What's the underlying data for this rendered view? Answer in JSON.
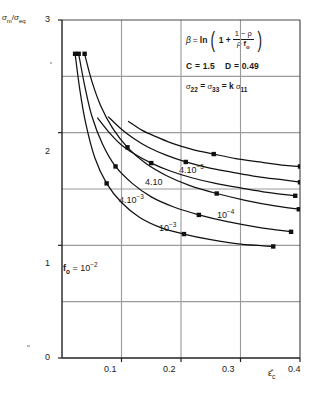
{
  "chart_data": {
    "type": "line",
    "title": "",
    "xlabel": "ε̂c",
    "ylabel": "σm/σeq",
    "xlim": [
      0,
      0.4
    ],
    "ylim": [
      0,
      3
    ],
    "grid": true,
    "legend_position": "inline-annotations",
    "x_ticks": [
      "0.1",
      "0.2",
      "0.3",
      "0.4"
    ],
    "x_tick_values": [
      0.1,
      0.2,
      0.3,
      0.4
    ],
    "y_ticks": [
      "0",
      "1",
      "2",
      "3"
    ],
    "y_tick_values": [
      0,
      1,
      2,
      3
    ],
    "x_gridlines": [
      0.1,
      0.2,
      0.3
    ],
    "y_gridlines": [
      0.5,
      1.0,
      1.5,
      2.0,
      2.5
    ],
    "series": [
      {
        "name": "f_o = 10^-2",
        "label": "fₒ = 10⁻²",
        "marker": "square",
        "x": [
          0.022,
          0.03,
          0.04,
          0.055,
          0.075,
          0.1,
          0.13,
          0.165,
          0.205,
          0.25,
          0.3,
          0.355
        ],
        "y": [
          2.7,
          2.38,
          2.08,
          1.78,
          1.55,
          1.38,
          1.25,
          1.16,
          1.1,
          1.05,
          1.01,
          0.99
        ],
        "marker_points": [
          [
            0.022,
            2.7
          ],
          [
            0.075,
            1.55
          ],
          [
            0.205,
            1.1
          ],
          [
            0.355,
            0.99
          ]
        ]
      },
      {
        "name": "4.10^-3",
        "label": "4.10⁻³",
        "marker": "square",
        "x": [
          0.028,
          0.038,
          0.05,
          0.068,
          0.09,
          0.118,
          0.15,
          0.188,
          0.23,
          0.278,
          0.33,
          0.385
        ],
        "y": [
          2.7,
          2.42,
          2.15,
          1.9,
          1.7,
          1.55,
          1.43,
          1.34,
          1.27,
          1.21,
          1.16,
          1.12
        ],
        "marker_points": [
          [
            0.028,
            2.7
          ],
          [
            0.09,
            1.7
          ],
          [
            0.23,
            1.27
          ],
          [
            0.385,
            1.12
          ]
        ]
      },
      {
        "name": "10^-3",
        "label": "10⁻³",
        "marker": "square",
        "x": [
          0.038,
          0.05,
          0.065,
          0.085,
          0.11,
          0.14,
          0.175,
          0.215,
          0.26,
          0.308,
          0.358,
          0.398
        ],
        "y": [
          2.7,
          2.46,
          2.24,
          2.04,
          1.87,
          1.73,
          1.62,
          1.53,
          1.46,
          1.4,
          1.35,
          1.32
        ],
        "marker_points": [
          [
            0.038,
            2.7
          ],
          [
            0.11,
            1.87
          ],
          [
            0.26,
            1.46
          ],
          [
            0.398,
            1.32
          ]
        ]
      },
      {
        "name": "4.10^-4",
        "label": "4.10",
        "marker": "square",
        "x": [
          0.06,
          0.078,
          0.098,
          0.122,
          0.15,
          0.182,
          0.218,
          0.258,
          0.3,
          0.345,
          0.392
        ],
        "y": [
          2.13,
          2.01,
          1.9,
          1.81,
          1.73,
          1.66,
          1.6,
          1.55,
          1.51,
          1.47,
          1.44
        ],
        "marker_points": [
          [
            0.15,
            1.73
          ],
          [
            0.392,
            1.44
          ]
        ]
      },
      {
        "name": "10^-4",
        "label": "10⁻⁴",
        "marker": "square",
        "x": [
          0.078,
          0.098,
          0.12,
          0.145,
          0.175,
          0.208,
          0.245,
          0.285,
          0.328,
          0.372,
          0.4
        ],
        "y": [
          2.14,
          2.04,
          1.95,
          1.87,
          1.8,
          1.74,
          1.69,
          1.65,
          1.61,
          1.58,
          1.56
        ],
        "marker_points": [
          [
            0.208,
            1.74
          ],
          [
            0.4,
            1.56
          ]
        ]
      },
      {
        "name": "4.10^-5",
        "label": "4.10⁻⁵",
        "marker": "square",
        "x": [
          0.112,
          0.135,
          0.16,
          0.188,
          0.22,
          0.255,
          0.292,
          0.332,
          0.375,
          0.4
        ],
        "y": [
          2.1,
          2.02,
          1.96,
          1.9,
          1.85,
          1.81,
          1.77,
          1.74,
          1.71,
          1.7
        ],
        "marker_points": [
          [
            0.255,
            1.81
          ],
          [
            0.4,
            1.7
          ]
        ]
      }
    ],
    "annotations": [
      {
        "id": "eq-beta",
        "text": "β = ln (1 + (1−ρ)/(ρ fₒ))"
      },
      {
        "id": "eq-constants",
        "text": "C = 1.5   D = 0.49"
      },
      {
        "id": "eq-stress",
        "text": "σ₂₂ = σ₃₃ = k σ₁₁"
      }
    ]
  },
  "axes": {
    "ylabel": {
      "sigma": "σ",
      "sub_m": "m",
      "slash": "/",
      "sigma2": "σ",
      "sub_eq": "eq"
    },
    "xlabel": {
      "symbol": "ε̂",
      "sub": "c"
    },
    "y_ticks": [
      "3",
      "2",
      "1",
      "0"
    ],
    "x_ticks": [
      "0.1",
      "0.2",
      "0.3",
      "0.4"
    ]
  },
  "equation_box": {
    "beta_symbol": "β",
    "equals": "=",
    "ln": "ln",
    "open_paren": "(",
    "one_plus": "1 +",
    "numerator": "1 − ρ",
    "den_rho": "ρ",
    "den_f": "f",
    "den_sub": "o",
    "close_paren": ")",
    "c_label": "C = 1.5",
    "d_label": "D = 0.49",
    "stress_s1": "σ",
    "stress_sub1": "22",
    "stress_eq1": "=",
    "stress_s2": "σ",
    "stress_sub2": "33",
    "stress_eq2": "=",
    "stress_k": "k",
    "stress_s3": "σ",
    "stress_sub3": "11"
  },
  "curve_labels": {
    "c1_prefix": "f",
    "c1_sub": "o",
    "c1_rest": " = 10",
    "c1_sup": "−2",
    "c2_base": "4.10",
    "c2_sup": "−3",
    "c3_base": "10",
    "c3_sup": "−3",
    "c4_base": "4.10",
    "c4_sup": "",
    "c5_base": "10",
    "c5_sup": "−4",
    "c6_base": "4.10",
    "c6_sup": "−5"
  },
  "colors": {
    "curve": "#111111",
    "grid": "#9a9a9a",
    "axis": "#4a4a4a",
    "text": "#1a1a1a",
    "background": "#ffffff"
  }
}
